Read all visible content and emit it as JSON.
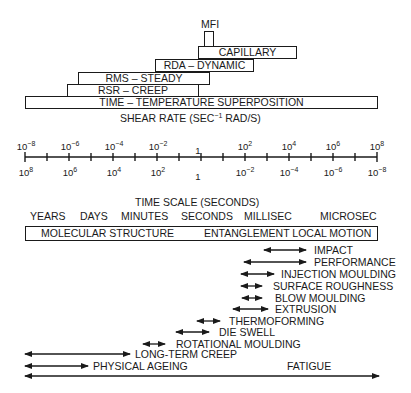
{
  "techniques": {
    "mfi": {
      "label": "MFI"
    },
    "capillary": {
      "label": "CAPILLARY"
    },
    "rda": {
      "label": "RDA – DYNAMIC"
    },
    "rms": {
      "label": "RMS – STEADY"
    },
    "rsr": {
      "label": "RSR – CREEP"
    },
    "tts": {
      "label": "TIME – TEMPERATURE SUPERPOSITION"
    }
  },
  "shear_axis": {
    "title": "SHEAR RATE (SEC",
    "title_sup": "−1",
    "title_tail": " RAD/S)",
    "top_ticks": [
      {
        "base": "10",
        "exp": "−8"
      },
      {
        "base": "10",
        "exp": "−6"
      },
      {
        "base": "10",
        "exp": "−4"
      },
      {
        "base": "10",
        "exp": "−2"
      },
      {
        "base": "1",
        "exp": ""
      },
      {
        "base": "10",
        "exp": "2"
      },
      {
        "base": "10",
        "exp": "4"
      },
      {
        "base": "10",
        "exp": "6"
      },
      {
        "base": "10",
        "exp": "8"
      }
    ],
    "bottom_ticks": [
      {
        "base": "10",
        "exp": "8"
      },
      {
        "base": "10",
        "exp": "6"
      },
      {
        "base": "10",
        "exp": "4"
      },
      {
        "base": "10",
        "exp": "2"
      },
      {
        "base": "1",
        "exp": ""
      },
      {
        "base": "10",
        "exp": "−2"
      },
      {
        "base": "10",
        "exp": "−4"
      },
      {
        "base": "10",
        "exp": "−6"
      },
      {
        "base": "10",
        "exp": "−8"
      }
    ]
  },
  "time_scale": {
    "title": "TIME SCALE (SECONDS)",
    "units": [
      "YEARS",
      "DAYS",
      "MINUTES",
      "SECONDS",
      "MILLISEC",
      "MICROSEC"
    ]
  },
  "structure_box": {
    "left": "MOLECULAR STRUCTURE",
    "right": "ENTANGLEMENT LOCAL MOTION"
  },
  "processes": [
    {
      "label": "IMPACT"
    },
    {
      "label": "PERFORMANCE"
    },
    {
      "label": "INJECTION MOULDING"
    },
    {
      "label": "SURFACE ROUGHNESS"
    },
    {
      "label": "BLOW MOULDING"
    },
    {
      "label": "EXTRUSION"
    },
    {
      "label": "THERMOFORMING"
    },
    {
      "label": "DIE SWELL"
    },
    {
      "label": "ROTATIONAL MOULDING"
    },
    {
      "label": "LONG-TERM CREEP"
    },
    {
      "label": "PHYSICAL AGEING"
    },
    {
      "label": "FATIGUE"
    }
  ]
}
